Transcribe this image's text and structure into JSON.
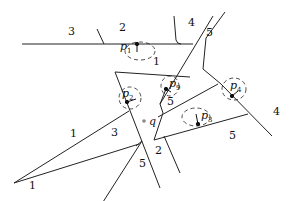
{
  "diagram": {
    "region_labels": [
      {
        "id": "r3-top",
        "text": "3",
        "x": 68,
        "y": 26
      },
      {
        "id": "r2-top",
        "text": "2",
        "x": 119,
        "y": 22
      },
      {
        "id": "r4-top",
        "text": "4",
        "x": 188,
        "y": 17
      },
      {
        "id": "r5-top",
        "text": "5",
        "x": 206,
        "y": 27
      },
      {
        "id": "r1-mid",
        "text": "1",
        "x": 153,
        "y": 56
      },
      {
        "id": "r1-left",
        "text": "1",
        "x": 70,
        "y": 128
      },
      {
        "id": "r5-p9",
        "text": "5",
        "x": 167,
        "y": 96
      },
      {
        "id": "r3-mid",
        "text": "3",
        "x": 111,
        "y": 127
      },
      {
        "id": "r2-low",
        "text": "2",
        "x": 155,
        "y": 145
      },
      {
        "id": "r5-low",
        "text": "5",
        "x": 139,
        "y": 158
      },
      {
        "id": "r5-right",
        "text": "5",
        "x": 229,
        "y": 130
      },
      {
        "id": "r4-right",
        "text": "4",
        "x": 273,
        "y": 106
      },
      {
        "id": "r1-bottom",
        "text": "1",
        "x": 29,
        "y": 180
      }
    ],
    "points": [
      {
        "id": "p1",
        "label": "p",
        "sub": "1",
        "x": 137,
        "y": 44,
        "lx": 120,
        "ly": 41
      },
      {
        "id": "p2",
        "label": "p",
        "sub": "2",
        "x": 127,
        "y": 102,
        "lx": 122,
        "ly": 88
      },
      {
        "id": "p9",
        "label": "p",
        "sub": "9",
        "x": 166,
        "y": 89,
        "lx": 169,
        "ly": 78
      },
      {
        "id": "p4",
        "label": "p",
        "sub": "4",
        "x": 232,
        "y": 96,
        "lx": 230,
        "ly": 80
      },
      {
        "id": "p3",
        "label": "p",
        "sub": "3",
        "x": 198,
        "y": 124,
        "lx": 201,
        "ly": 110
      }
    ],
    "query": {
      "label": "q",
      "x": 144,
      "y": 121,
      "lx": 149,
      "ly": 116,
      "color": "#888888"
    },
    "line_color": "#222222"
  }
}
